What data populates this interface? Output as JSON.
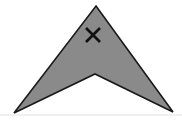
{
  "figure": {
    "background_color": "#ffffff",
    "width": 182,
    "height": 121,
    "shape": {
      "name": "arrowhead-chevron",
      "direction": "up",
      "fill_color": "#8a8a8a",
      "outline_color": "#1a1a1a",
      "outline_width": 1.6,
      "points": "96,6 173,112 95,74 14,113",
      "vertices": [
        {
          "label": "apex",
          "x": 96,
          "y": 6
        },
        {
          "label": "right-wing-tip",
          "x": 173,
          "y": 112
        },
        {
          "label": "bottom-notch",
          "x": 95,
          "y": 74
        },
        {
          "label": "left-wing-tip",
          "x": 14,
          "y": 113
        }
      ]
    },
    "annotation": {
      "name": "x-mark",
      "symbol": "X",
      "color": "#121212",
      "stroke_width": 2.6,
      "center_x": 93,
      "center_y": 35,
      "size": 14,
      "line_a": {
        "x1": 86,
        "y1": 28,
        "x2": 100,
        "y2": 42
      },
      "line_b": {
        "x1": 100,
        "y1": 28,
        "x2": 86,
        "y2": 42
      }
    },
    "baseline": {
      "name": "faint-baseline",
      "color": "#e2e2e2",
      "y": 115,
      "x1": 0,
      "x2": 182
    }
  }
}
